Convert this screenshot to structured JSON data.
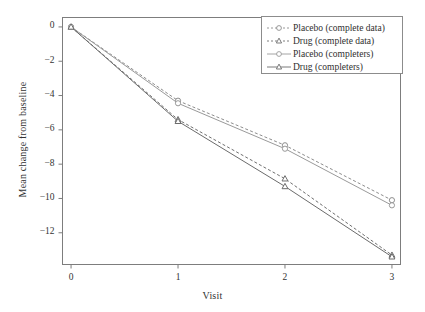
{
  "chart_data": {
    "type": "line",
    "title": "",
    "subtitle": "",
    "xlabel": "Visit",
    "ylabel": "Mean change from baseline",
    "x": [
      0,
      1,
      2,
      3
    ],
    "xticks": [
      "0",
      "1",
      "2",
      "3"
    ],
    "yticks": [
      "0",
      "-2",
      "-4",
      "-6",
      "-8",
      "-10",
      "-12"
    ],
    "ytick_values": [
      0,
      -2,
      -4,
      -6,
      -8,
      -10,
      -12
    ],
    "xlim": [
      -0.08,
      3.08
    ],
    "ylim": [
      -13.85,
      0.55
    ],
    "grid": false,
    "legend_position": "top-right",
    "series": [
      {
        "name": "Placebo (complete data)",
        "values": [
          0,
          -4.3,
          -6.9,
          -10.1
        ],
        "marker": "circle",
        "linestyle": "dashed",
        "color": "#8d8d8d"
      },
      {
        "name": "Drug (complete data)",
        "values": [
          0,
          -5.4,
          -8.85,
          -13.3
        ],
        "marker": "triangle",
        "linestyle": "dashed",
        "color": "#6f6f6f"
      },
      {
        "name": "Placebo (completers)",
        "values": [
          0,
          -4.45,
          -7.1,
          -10.4
        ],
        "marker": "circle",
        "linestyle": "solid",
        "color": "#9a9a9a"
      },
      {
        "name": "Drug (completers)",
        "values": [
          0,
          -5.5,
          -9.3,
          -13.4
        ],
        "marker": "triangle",
        "linestyle": "solid",
        "color": "#6b6b6b"
      }
    ]
  },
  "axes": {
    "frame_color": "#7a7a7a",
    "background": "#ffffff"
  },
  "legend": {
    "entries": [
      "Placebo (complete data)",
      "Drug (complete data)",
      "Placebo (completers)",
      "Drug (completers)"
    ]
  }
}
